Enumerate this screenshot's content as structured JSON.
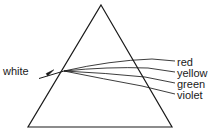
{
  "diagram": {
    "background_color": "#ffffff",
    "stroke_color": "#1a1a1a",
    "prism": {
      "name": "triangular-prism",
      "apex": {
        "x": 101,
        "y": 5
      },
      "base_left": {
        "x": 28,
        "y": 127
      },
      "base_right": {
        "x": 172,
        "y": 127
      },
      "stroke_width": 1.1
    },
    "incident": {
      "label": "white",
      "arrow_from": {
        "x": 39,
        "y": 78
      },
      "arrow_to": {
        "x": 53,
        "y": 70
      },
      "entry_point": {
        "x": 64,
        "y": 71
      }
    },
    "rays": [
      {
        "label": "red",
        "inside_end": {
          "x": 152,
          "y": 59
        },
        "exit_end": {
          "x": 175,
          "y": 61
        }
      },
      {
        "label": "yellow",
        "inside_end": {
          "x": 148,
          "y": 68
        },
        "exit_end": {
          "x": 175,
          "y": 72
        }
      },
      {
        "label": "green",
        "inside_end": {
          "x": 145,
          "y": 77
        },
        "exit_end": {
          "x": 175,
          "y": 83
        }
      },
      {
        "label": "violet",
        "inside_end": {
          "x": 142,
          "y": 86
        },
        "exit_end": {
          "x": 175,
          "y": 94
        }
      }
    ]
  }
}
